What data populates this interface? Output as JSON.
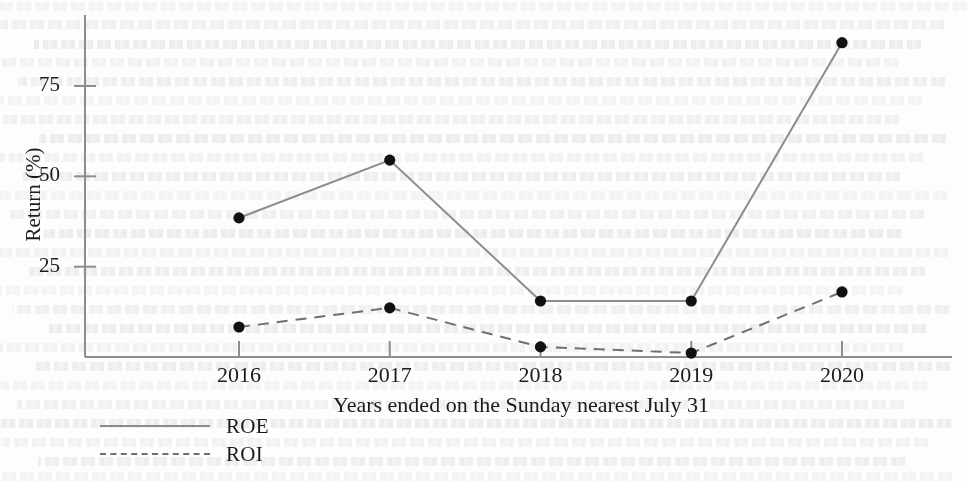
{
  "chart_data": {
    "type": "line",
    "title": "",
    "xlabel": "Years ended on the Sunday nearest July 31",
    "ylabel": "Return (%)",
    "categories": [
      "2016",
      "2017",
      "2018",
      "2019",
      "2020"
    ],
    "xticklabels": [
      "2016",
      "2017",
      "2018",
      "2019",
      "2020"
    ],
    "yticklabels": [
      "25",
      "50",
      "75"
    ],
    "yticks": [
      25,
      50,
      75
    ],
    "ylim": [
      0,
      95
    ],
    "grid": false,
    "legend_position": "below-left",
    "series": [
      {
        "name": "ROE",
        "style": "solid",
        "color": "#8c8c8c",
        "marker": "filled-circle",
        "values": [
          38.5,
          54.5,
          15.5,
          15.5,
          87.0
        ]
      },
      {
        "name": "ROI",
        "style": "dashed",
        "color": "#6f6f6f",
        "marker": "filled-circle",
        "values": [
          8.3,
          13.6,
          2.8,
          1.1,
          18.0
        ]
      }
    ]
  },
  "legend": {
    "items": [
      {
        "label": "ROE",
        "style": "solid"
      },
      {
        "label": "ROI",
        "style": "dashed"
      }
    ]
  },
  "axes": {
    "y_axis_label": "Return (%)",
    "x_axis_label": "Years ended on the Sunday nearest July 31"
  },
  "colors": {
    "roe_line": "#8c8c8c",
    "roi_line": "#6f6f6f",
    "marker": "#111111",
    "axis": "#8d8d8d",
    "text": "#1b1b1b",
    "background": "#fdfdfc"
  }
}
